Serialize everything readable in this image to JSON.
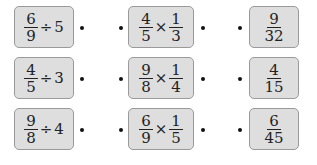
{
  "left_column": [
    {
      "numerator": "6",
      "denominator": "9",
      "operator": "÷",
      "operand": "5"
    },
    {
      "numerator": "4",
      "denominator": "5",
      "operator": "÷",
      "operand": "3"
    },
    {
      "numerator": "9",
      "denominator": "8",
      "operator": "÷",
      "operand": "4"
    }
  ],
  "middle_column": [
    {
      "a_num": "4",
      "a_den": "5",
      "operator": "×",
      "b_num": "1",
      "b_den": "3"
    },
    {
      "a_num": "9",
      "a_den": "8",
      "operator": "×",
      "b_num": "1",
      "b_den": "4"
    },
    {
      "a_num": "6",
      "a_den": "9",
      "operator": "×",
      "b_num": "1",
      "b_den": "5"
    }
  ],
  "right_column": [
    {
      "numerator": "9",
      "denominator": "32"
    },
    {
      "numerator": "4",
      "denominator": "15"
    },
    {
      "numerator": "6",
      "denominator": "45"
    }
  ],
  "colors": {
    "box_fill": "#dedede",
    "box_border": "#9a9a9a",
    "dot": "#111111"
  }
}
